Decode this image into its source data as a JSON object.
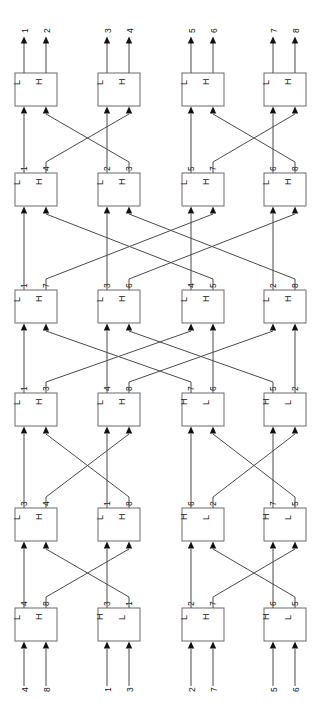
{
  "diagram": {
    "type": "sorting-network",
    "orientation": "rotated-90-ccw",
    "flow": "bottom-to-top",
    "num_lines": 8,
    "num_stages": 6,
    "box_port_labels": {
      "low": "L",
      "high": "H"
    },
    "colors": {
      "wire": "#4a4a4a",
      "box_stroke": "#6a6a6a",
      "arrow": "#111111",
      "background": "#ffffff"
    }
  },
  "geometry": {
    "columns_x": [
      15,
      98,
      182,
      264
    ],
    "box_width": 42,
    "box_height": 33,
    "port_offsets": [
      9,
      31
    ],
    "rows_y": [
      73,
      173,
      290,
      393,
      508,
      608
    ]
  },
  "inputs": {
    "name": "bottom-inputs",
    "labels": [
      "4",
      "8",
      "1",
      "3",
      "2",
      "7",
      "5",
      "6"
    ]
  },
  "outputs": {
    "name": "top-outputs",
    "labels": [
      "1",
      "2",
      "3",
      "4",
      "5",
      "6",
      "7",
      "8"
    ]
  },
  "stages": [
    {
      "index": 1,
      "name": "stage-1-top",
      "boxes": [
        {
          "name": "box-r1-c1",
          "ports": [
            "L",
            "H"
          ],
          "out_labels": [
            "",
            ""
          ]
        },
        {
          "name": "box-r1-c2",
          "ports": [
            "L",
            "H"
          ],
          "out_labels": [
            "",
            ""
          ]
        },
        {
          "name": "box-r1-c3",
          "ports": [
            "L",
            "H"
          ],
          "out_labels": [
            "",
            ""
          ]
        },
        {
          "name": "box-r1-c4",
          "ports": [
            "L",
            "H"
          ],
          "out_labels": [
            "",
            ""
          ]
        }
      ]
    },
    {
      "index": 2,
      "name": "stage-2",
      "boxes": [
        {
          "name": "box-r2-c1",
          "ports": [
            "L",
            "H"
          ],
          "out_labels": [
            "1",
            "4"
          ]
        },
        {
          "name": "box-r2-c2",
          "ports": [
            "L",
            "H"
          ],
          "out_labels": [
            "2",
            "3"
          ]
        },
        {
          "name": "box-r2-c3",
          "ports": [
            "L",
            "H"
          ],
          "out_labels": [
            "5",
            "7"
          ]
        },
        {
          "name": "box-r2-c4",
          "ports": [
            "L",
            "H"
          ],
          "out_labels": [
            "6",
            "8"
          ]
        }
      ]
    },
    {
      "index": 3,
      "name": "stage-3",
      "boxes": [
        {
          "name": "box-r3-c1",
          "ports": [
            "L",
            "H"
          ],
          "out_labels": [
            "1",
            "7"
          ]
        },
        {
          "name": "box-r3-c2",
          "ports": [
            "L",
            "H"
          ],
          "out_labels": [
            "3",
            "6"
          ]
        },
        {
          "name": "box-r3-c3",
          "ports": [
            "L",
            "H"
          ],
          "out_labels": [
            "4",
            "5"
          ]
        },
        {
          "name": "box-r3-c4",
          "ports": [
            "L",
            "H"
          ],
          "out_labels": [
            "2",
            "8"
          ]
        }
      ]
    },
    {
      "index": 4,
      "name": "stage-4",
      "boxes": [
        {
          "name": "box-r4-c1",
          "ports": [
            "L",
            "H"
          ],
          "out_labels": [
            "1",
            "3"
          ]
        },
        {
          "name": "box-r4-c2",
          "ports": [
            "L",
            "H"
          ],
          "out_labels": [
            "4",
            "8"
          ]
        },
        {
          "name": "box-r4-c3",
          "ports": [
            "H",
            "L"
          ],
          "out_labels": [
            "7",
            "6"
          ]
        },
        {
          "name": "box-r4-c4",
          "ports": [
            "H",
            "L"
          ],
          "out_labels": [
            "5",
            "2"
          ]
        }
      ]
    },
    {
      "index": 5,
      "name": "stage-5",
      "boxes": [
        {
          "name": "box-r5-c1",
          "ports": [
            "L",
            "H"
          ],
          "out_labels": [
            "3",
            "4"
          ]
        },
        {
          "name": "box-r5-c2",
          "ports": [
            "L",
            "H"
          ],
          "out_labels": [
            "1",
            "8"
          ]
        },
        {
          "name": "box-r5-c3",
          "ports": [
            "H",
            "L"
          ],
          "out_labels": [
            "6",
            "2"
          ]
        },
        {
          "name": "box-r5-c4",
          "ports": [
            "H",
            "L"
          ],
          "out_labels": [
            "7",
            "5"
          ]
        }
      ]
    },
    {
      "index": 6,
      "name": "stage-6-bottom",
      "boxes": [
        {
          "name": "box-r6-c1",
          "ports": [
            "L",
            "H"
          ],
          "out_labels": [
            "4",
            "8"
          ]
        },
        {
          "name": "box-r6-c2",
          "ports": [
            "H",
            "L"
          ],
          "out_labels": [
            "3",
            "1"
          ]
        },
        {
          "name": "box-r6-c3",
          "ports": [
            "L",
            "H"
          ],
          "out_labels": [
            "2",
            "7"
          ]
        },
        {
          "name": "box-r6-c4",
          "ports": [
            "H",
            "L"
          ],
          "out_labels": [
            "6",
            "5"
          ]
        }
      ]
    }
  ],
  "wiring": {
    "note": "permutation of port indices 0..7 from stage n output (upper) to stage n-1 input",
    "stage1_from_stage2": [
      0,
      3,
      2,
      1,
      4,
      7,
      6,
      5
    ],
    "stage2_from_stage3": [
      0,
      5,
      2,
      7,
      4,
      1,
      6,
      3
    ],
    "stage3_from_stage4": [
      0,
      4,
      2,
      6,
      1,
      5,
      3,
      7
    ],
    "stage4_from_stage5": [
      0,
      3,
      2,
      1,
      4,
      7,
      6,
      5
    ],
    "stage5_from_stage6": [
      0,
      3,
      2,
      1,
      4,
      7,
      6,
      5
    ]
  }
}
